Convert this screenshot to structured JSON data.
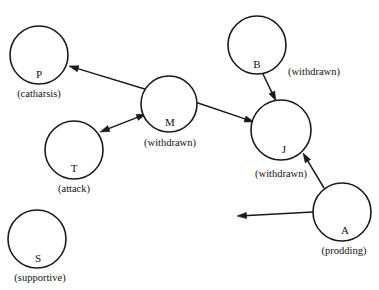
{
  "diagram": {
    "canvas": {
      "width": 379,
      "height": 290,
      "background": "#ffffff"
    },
    "stroke_color": "#1a1a1a",
    "nodes": [
      {
        "id": "P",
        "letter": "P",
        "role": "(catharsis)",
        "cx": 39,
        "cy": 55,
        "r": 29,
        "letter_x": 39,
        "letter_y": 78,
        "role_x": 39,
        "role_y": 97,
        "role_anchor": "middle"
      },
      {
        "id": "M",
        "letter": "M",
        "role": "(withdrawn)",
        "cx": 169,
        "cy": 104,
        "r": 28,
        "letter_x": 170,
        "letter_y": 126,
        "role_x": 170,
        "role_y": 146,
        "role_anchor": "middle"
      },
      {
        "id": "T",
        "letter": "T",
        "role": "(attack)",
        "cx": 74,
        "cy": 150,
        "r": 29,
        "letter_x": 74,
        "letter_y": 172,
        "role_x": 74,
        "role_y": 192,
        "role_anchor": "middle"
      },
      {
        "id": "B",
        "letter": "B",
        "role": "(withdrawn)",
        "cx": 257,
        "cy": 45,
        "r": 29,
        "letter_x": 257,
        "letter_y": 68,
        "role_x": 288,
        "role_y": 75,
        "role_anchor": "start"
      },
      {
        "id": "J",
        "letter": "J",
        "role": "(withdrawn)",
        "cx": 281,
        "cy": 130,
        "r": 30,
        "letter_x": 284,
        "letter_y": 153,
        "role_x": 281,
        "role_y": 177,
        "role_anchor": "middle"
      },
      {
        "id": "A",
        "letter": "A",
        "role": "(prodding)",
        "cx": 342,
        "cy": 212,
        "r": 29,
        "letter_x": 345,
        "letter_y": 234,
        "role_x": 344,
        "role_y": 254,
        "role_anchor": "middle"
      },
      {
        "id": "S",
        "letter": "S",
        "role": "(supportive)",
        "cx": 37,
        "cy": 239,
        "r": 29,
        "letter_x": 38,
        "letter_y": 262,
        "role_x": 40,
        "role_y": 281,
        "role_anchor": "middle"
      }
    ],
    "edges": [
      {
        "id": "edge-m-to-p",
        "from": "M",
        "to": "P",
        "x1": 148,
        "y1": 90,
        "x2": 69,
        "y2": 66,
        "arrow_at_start": false,
        "arrow_at_end": true
      },
      {
        "id": "edge-t-to-m",
        "from": "T",
        "to": "M",
        "x1": 100,
        "y1": 132,
        "x2": 146,
        "y2": 114,
        "arrow_at_start": true,
        "arrow_at_end": true
      },
      {
        "id": "edge-m-to-j",
        "from": "M",
        "to": "J",
        "x1": 195,
        "y1": 102,
        "x2": 254,
        "y2": 122,
        "arrow_at_start": false,
        "arrow_at_end": true
      },
      {
        "id": "edge-b-to-j",
        "from": "B",
        "to": "J",
        "x1": 262,
        "y1": 72,
        "x2": 276,
        "y2": 101,
        "arrow_at_start": false,
        "arrow_at_end": true
      },
      {
        "id": "edge-a-to-j",
        "from": "A",
        "to": "J",
        "x1": 324,
        "y1": 188,
        "x2": 303,
        "y2": 153,
        "arrow_at_start": false,
        "arrow_at_end": true
      },
      {
        "id": "edge-a-outward",
        "from": "A",
        "to": "",
        "x1": 313,
        "y1": 212,
        "x2": 237,
        "y2": 216,
        "arrow_at_start": false,
        "arrow_at_end": true
      }
    ]
  }
}
